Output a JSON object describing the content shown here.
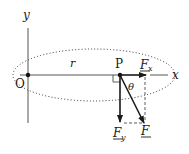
{
  "diagram": {
    "axes": {
      "x_label": "x",
      "y_label": "y",
      "origin_label": "O"
    },
    "point_label": "P",
    "radius_label": "r",
    "angle_label": "θ",
    "vectors": [
      {
        "name": "F_x",
        "label": "F",
        "subscript": "x",
        "underlined": true,
        "direction": "horizontal"
      },
      {
        "name": "F_y",
        "label": "F",
        "subscript": "y",
        "underlined": true,
        "direction": "vertical-down"
      },
      {
        "name": "F",
        "label": "F",
        "subscript": "",
        "underlined": true,
        "direction": "resultant"
      }
    ],
    "colors": {
      "ink": "#1a1a1a",
      "axis": "#555555",
      "dotted_path": "#333333"
    }
  }
}
